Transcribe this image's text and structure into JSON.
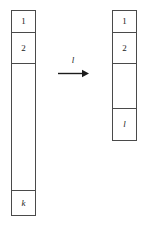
{
  "figure": {
    "background_color": "#ffffff",
    "stroke_color": "#4a4a4a",
    "text_color": "#1b1b1b"
  },
  "left_column": {
    "name": "source-column",
    "cells": [
      {
        "label": "1",
        "style": "upright"
      },
      {
        "label": "2",
        "style": "upright"
      },
      {
        "label": "",
        "style": "upright"
      },
      {
        "label": "k",
        "style": "italic"
      }
    ]
  },
  "right_column": {
    "name": "target-column",
    "cells": [
      {
        "label": "1",
        "style": "upright"
      },
      {
        "label": "2",
        "style": "upright"
      },
      {
        "label": "",
        "style": "upright"
      },
      {
        "label": "l",
        "style": "italic"
      }
    ]
  },
  "arrow": {
    "label": "l",
    "direction": "right",
    "color": "#1b1b1b"
  }
}
